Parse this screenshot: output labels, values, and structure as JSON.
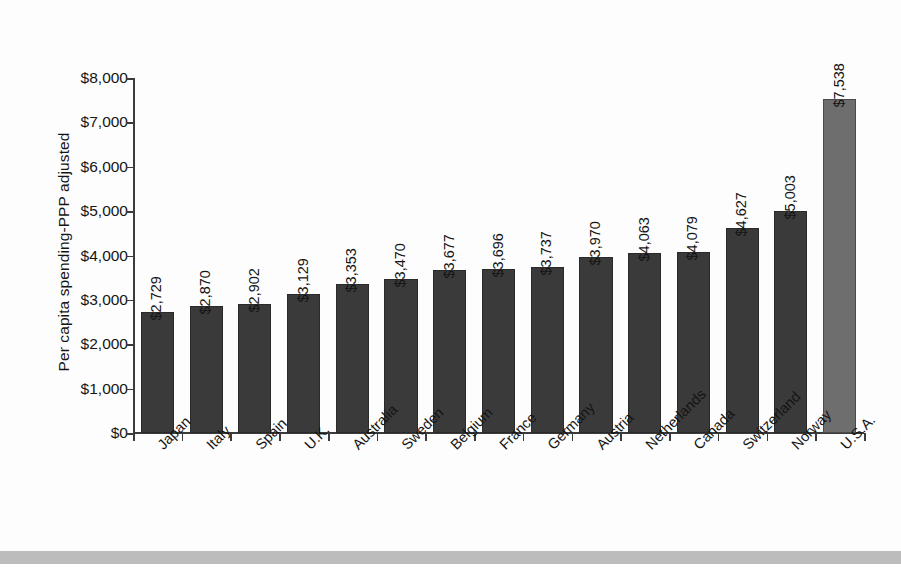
{
  "chart_data": {
    "type": "bar",
    "title": "",
    "xlabel": "",
    "ylabel": "Per capita spending-PPP adjusted",
    "ylim": [
      0,
      8000
    ],
    "ytick_labels": [
      "$8,000",
      "$7,000",
      "$6,000",
      "$5,000",
      "$4,000",
      "$3,000",
      "$2,000",
      "$1,000",
      "$0"
    ],
    "ytick_values": [
      8000,
      7000,
      6000,
      5000,
      4000,
      3000,
      2000,
      1000,
      0
    ],
    "grid": false,
    "legend": "none",
    "categories": [
      "Japan",
      "Italy",
      "Spain",
      "U.K.",
      "Australia",
      "Sweden",
      "Belgium",
      "France",
      "Germany",
      "Austria",
      "Netherlands",
      "Canada",
      "Switzerland",
      "Norway",
      "U.S.A."
    ],
    "values": [
      2729,
      2870,
      2902,
      3129,
      3353,
      3470,
      3677,
      3696,
      3737,
      3970,
      4063,
      4079,
      4627,
      5003,
      7538
    ],
    "data_labels": [
      "$2,729",
      "$2,870",
      "$2,902",
      "$3,129",
      "$3,353",
      "$3,470",
      "$3,677",
      "$3,696",
      "$3,737",
      "$3,970",
      "$4,063",
      "$4,079",
      "$4,627",
      "$5,003",
      "$7,538"
    ],
    "highlight_index": 14,
    "colors": {
      "bar": "#3a3a3a",
      "bar_highlight": "#6e6e6e",
      "axis": "#3b3b3b",
      "text": "#141414",
      "background": "#fdfdfd",
      "footer_band": "#bcbcbc"
    }
  }
}
